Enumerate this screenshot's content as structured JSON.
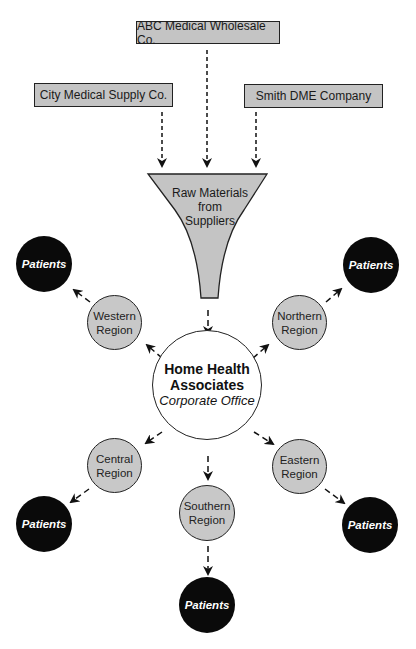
{
  "suppliers": [
    {
      "label": "ABC Medical Wholesale Co."
    },
    {
      "label": "City Medical Supply Co."
    },
    {
      "label": "Smith DME Company"
    }
  ],
  "funnel": {
    "line1": "Raw Materials",
    "line2": "from",
    "line3": "Suppliers"
  },
  "hq": {
    "line1": "Home Health",
    "line2": "Associates",
    "line3": "Corporate Office"
  },
  "regions": {
    "western": {
      "line1": "Western",
      "line2": "Region"
    },
    "northern": {
      "line1": "Northern",
      "line2": "Region"
    },
    "central": {
      "line1": "Central",
      "line2": "Region"
    },
    "southern": {
      "line1": "Southern",
      "line2": "Region"
    },
    "eastern": {
      "line1": "Eastern",
      "line2": "Region"
    }
  },
  "patients": {
    "label": "Patients"
  },
  "colors": {
    "box_fill": "#c4c4c4",
    "region_fill": "#c8c8c8",
    "patients_fill": "#0a0a0a",
    "stroke": "#222222"
  }
}
